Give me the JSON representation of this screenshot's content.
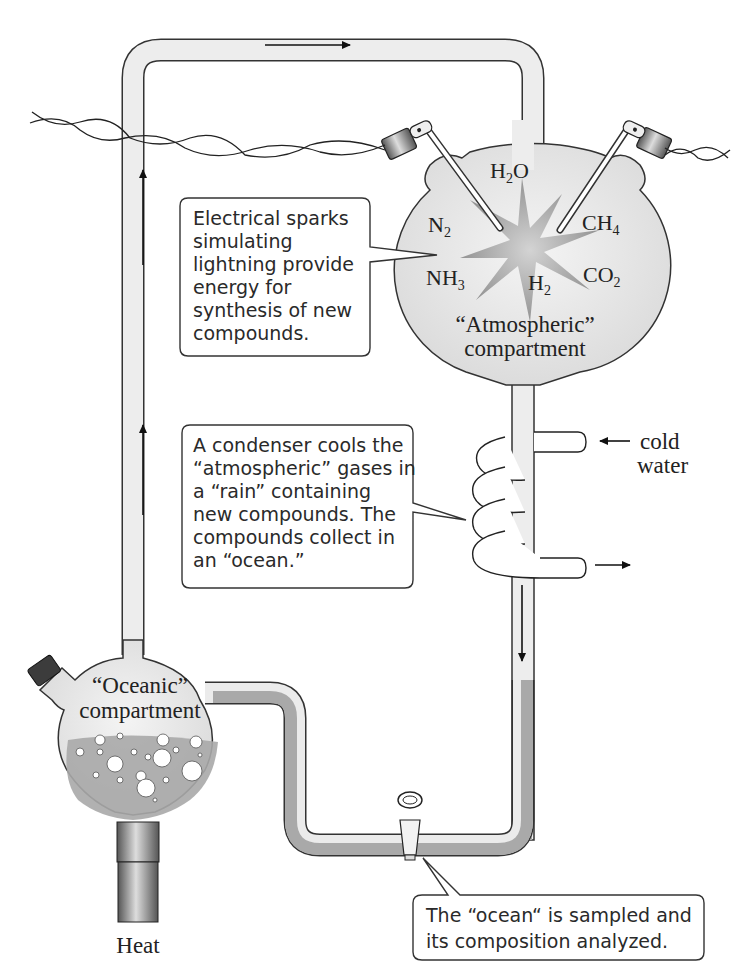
{
  "diagram": {
    "colors": {
      "glass_fill": "#ececec",
      "glass_stroke": "#333333",
      "water_fill": "#a9a9a9",
      "spark_fill": "#9a9a9a",
      "background": "#ffffff"
    },
    "atmospheric_compartment": {
      "label_line1": "“Atmospheric”",
      "label_line2": "compartment",
      "molecules": [
        {
          "base": "H",
          "sub": "2",
          "tail": "O"
        },
        {
          "base": "N",
          "sub": "2",
          "tail": ""
        },
        {
          "base": "CH",
          "sub": "4",
          "tail": ""
        },
        {
          "base": "NH",
          "sub": "3",
          "tail": ""
        },
        {
          "base": "H",
          "sub": "2",
          "tail": ""
        },
        {
          "base": "CO",
          "sub": "2",
          "tail": ""
        }
      ]
    },
    "oceanic_compartment": {
      "label_line1": "“Oceanic”",
      "label_line2": "compartment"
    },
    "heat_label": "Heat",
    "cold_water": {
      "line1": "cold",
      "line2": "water"
    },
    "callouts": [
      {
        "id": "sparks",
        "lines": [
          "Electrical sparks",
          "simulating",
          "lightning provide",
          "energy for",
          "synthesis of new",
          "compounds."
        ]
      },
      {
        "id": "condenser",
        "lines": [
          "A condenser cools the",
          "“atmospheric” gases in",
          "a “rain” containing",
          "new compounds. The",
          "compounds collect in",
          "an “ocean.”"
        ]
      },
      {
        "id": "sample",
        "lines": [
          "The “ocean“ is sampled and",
          "its composition analyzed."
        ]
      }
    ],
    "arrows": [
      "flow-up-left-upper",
      "flow-up-left-lower",
      "flow-right-top",
      "flow-down-condenser",
      "cold-water-in",
      "water-out"
    ]
  }
}
